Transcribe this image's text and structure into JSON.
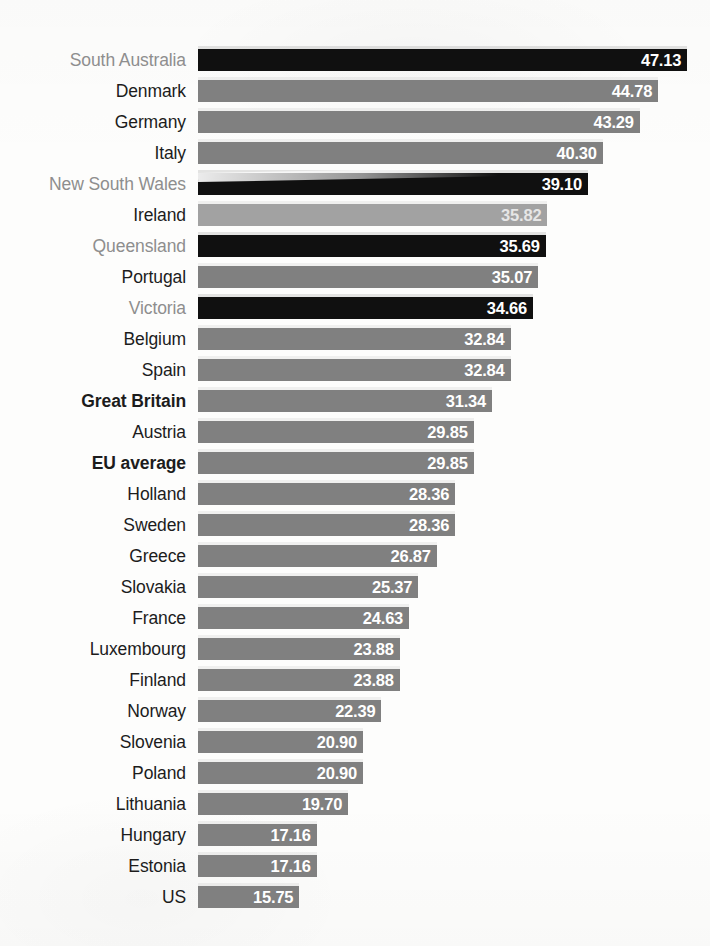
{
  "chart_data": {
    "type": "bar",
    "orientation": "horizontal",
    "title": "",
    "subtitle": "",
    "xlabel": "",
    "ylabel": "",
    "grid": false,
    "legend": false,
    "axis_visible": false,
    "sorted": "descending",
    "value_label_format": "0.00",
    "value_labels_inside_bars": true,
    "xlim": [
      0,
      47.13
    ],
    "categories": [
      "South Australia",
      "Denmark",
      "Germany",
      "Italy",
      "New South Wales",
      "Ireland",
      "Queensland",
      "Portugal",
      "Victoria",
      "Belgium",
      "Spain",
      "Great Britain",
      "Austria",
      "EU average",
      "Holland",
      "Sweden",
      "Greece",
      "Slovakia",
      "France",
      "Luxembourg",
      "Finland",
      "Norway",
      "Slovenia",
      "Poland",
      "Lithuania",
      "Hungary",
      "Estonia",
      "US"
    ],
    "values": [
      47.13,
      44.78,
      43.29,
      40.3,
      39.1,
      35.82,
      35.69,
      35.07,
      34.66,
      32.84,
      32.84,
      31.34,
      29.85,
      29.85,
      28.36,
      28.36,
      26.87,
      25.37,
      24.63,
      23.88,
      23.88,
      22.39,
      20.9,
      20.9,
      19.7,
      17.16,
      17.16,
      15.75
    ]
  },
  "colors": {
    "bar_default": "#808080",
    "bar_highlight": "#101010",
    "bar_faded": "#a2a2a2",
    "label_default": "#1c1c1c",
    "label_muted": "#8e8e8e",
    "value_text": "#ffffff",
    "background": "#fdfdfc"
  },
  "rows": [
    {
      "label": "South Australia",
      "value": "47.13",
      "style": "dark",
      "label_style": "muted"
    },
    {
      "label": "Denmark",
      "value": "44.78",
      "style": "normal",
      "label_style": "plain"
    },
    {
      "label": "Germany",
      "value": "43.29",
      "style": "normal",
      "label_style": "plain"
    },
    {
      "label": "Italy",
      "value": "40.30",
      "style": "normal",
      "label_style": "plain"
    },
    {
      "label": "New South Wales",
      "value": "39.10",
      "style": "dark",
      "label_style": "muted"
    },
    {
      "label": "Ireland",
      "value": "35.82",
      "style": "faded",
      "label_style": "plain"
    },
    {
      "label": "Queensland",
      "value": "35.69",
      "style": "dark",
      "label_style": "muted"
    },
    {
      "label": "Portugal",
      "value": "35.07",
      "style": "normal",
      "label_style": "plain"
    },
    {
      "label": "Victoria",
      "value": "34.66",
      "style": "dark",
      "label_style": "muted"
    },
    {
      "label": "Belgium",
      "value": "32.84",
      "style": "normal",
      "label_style": "plain"
    },
    {
      "label": "Spain",
      "value": "32.84",
      "style": "normal",
      "label_style": "plain"
    },
    {
      "label": "Great Britain",
      "value": "31.34",
      "style": "normal",
      "label_style": "strong"
    },
    {
      "label": "Austria",
      "value": "29.85",
      "style": "normal",
      "label_style": "plain"
    },
    {
      "label": "EU average",
      "value": "29.85",
      "style": "normal",
      "label_style": "strong"
    },
    {
      "label": "Holland",
      "value": "28.36",
      "style": "normal",
      "label_style": "plain"
    },
    {
      "label": "Sweden",
      "value": "28.36",
      "style": "normal",
      "label_style": "plain"
    },
    {
      "label": "Greece",
      "value": "26.87",
      "style": "normal",
      "label_style": "plain"
    },
    {
      "label": "Slovakia",
      "value": "25.37",
      "style": "normal",
      "label_style": "plain"
    },
    {
      "label": "France",
      "value": "24.63",
      "style": "normal",
      "label_style": "plain"
    },
    {
      "label": "Luxembourg",
      "value": "23.88",
      "style": "normal",
      "label_style": "plain"
    },
    {
      "label": "Finland",
      "value": "23.88",
      "style": "normal",
      "label_style": "plain"
    },
    {
      "label": "Norway",
      "value": "22.39",
      "style": "normal",
      "label_style": "plain"
    },
    {
      "label": "Slovenia",
      "value": "20.90",
      "style": "normal",
      "label_style": "plain"
    },
    {
      "label": "Poland",
      "value": "20.90",
      "style": "normal",
      "label_style": "plain"
    },
    {
      "label": "Lithuania",
      "value": "19.70",
      "style": "normal",
      "label_style": "plain"
    },
    {
      "label": "Hungary",
      "value": "17.16",
      "style": "normal",
      "label_style": "plain"
    },
    {
      "label": "Estonia",
      "value": "17.16",
      "style": "normal",
      "label_style": "plain"
    },
    {
      "label": "US",
      "value": "15.75",
      "style": "normal",
      "label_style": "plain"
    }
  ],
  "layout": {
    "bar_origin_x": 198,
    "px_per_unit": 12.36,
    "value_offset_units": 7.55,
    "first_row_top": 48,
    "row_pitch": 31.0,
    "bar_height": 22
  }
}
